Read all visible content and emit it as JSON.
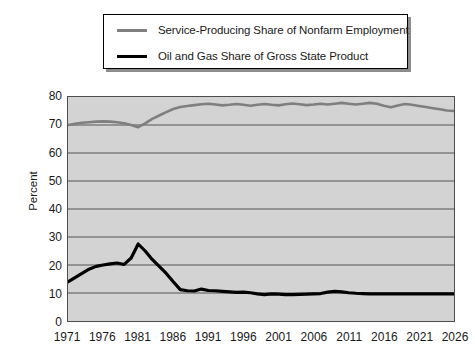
{
  "chart_data": {
    "type": "line",
    "title": "",
    "subtitle": "",
    "xlabel": "",
    "ylabel": "Percent",
    "ylim": [
      0,
      80
    ],
    "xlim": [
      1971,
      2026
    ],
    "yticks": [
      0,
      10,
      20,
      30,
      40,
      50,
      60,
      70,
      80
    ],
    "xticks": [
      1971,
      1976,
      1981,
      1986,
      1991,
      1996,
      2001,
      2006,
      2011,
      2016,
      2021,
      2026
    ],
    "grid": true,
    "legend_position": "above-plot",
    "plot_background": "#d3d3d3",
    "series": [
      {
        "name": "Service-Producing Share of Nonfarm Employment",
        "color": "#7f7f7f",
        "x": [
          1971,
          1972,
          1973,
          1974,
          1975,
          1976,
          1977,
          1978,
          1979,
          1980,
          1981,
          1982,
          1983,
          1984,
          1985,
          1986,
          1987,
          1988,
          1989,
          1990,
          1991,
          1992,
          1993,
          1994,
          1995,
          1996,
          1997,
          1998,
          1999,
          2000,
          2001,
          2002,
          2003,
          2004,
          2005,
          2006,
          2007,
          2008,
          2009,
          2010,
          2011,
          2012,
          2013,
          2014,
          2015,
          2016,
          2017,
          2018,
          2019,
          2020,
          2021,
          2022,
          2023,
          2024,
          2025,
          2026
        ],
        "values": [
          70.0,
          70.4,
          70.8,
          71.0,
          71.2,
          71.3,
          71.2,
          71.0,
          70.6,
          70.0,
          69.2,
          70.6,
          72.2,
          73.4,
          74.6,
          75.7,
          76.4,
          76.8,
          77.1,
          77.4,
          77.6,
          77.3,
          77.0,
          77.2,
          77.5,
          77.2,
          76.9,
          77.2,
          77.5,
          77.2,
          77.0,
          77.4,
          77.7,
          77.4,
          77.1,
          77.3,
          77.6,
          77.3,
          77.6,
          77.9,
          77.6,
          77.3,
          77.6,
          77.9,
          77.6,
          76.9,
          76.3,
          77.0,
          77.5,
          77.2,
          76.8,
          76.4,
          76.0,
          75.6,
          75.2,
          75.0
        ]
      },
      {
        "name": "Oil and Gas Share of Gross State Product",
        "color": "#000000",
        "x": [
          1971,
          1972,
          1973,
          1974,
          1975,
          1976,
          1977,
          1978,
          1979,
          1980,
          1981,
          1982,
          1983,
          1984,
          1985,
          1986,
          1987,
          1988,
          1989,
          1990,
          1991,
          1992,
          1993,
          1994,
          1995,
          1996,
          1997,
          1998,
          1999,
          2000,
          2001,
          2002,
          2003,
          2004,
          2005,
          2006,
          2007,
          2008,
          2009,
          2010,
          2011,
          2012,
          2013,
          2014,
          2015,
          2016,
          2017,
          2018,
          2019,
          2020,
          2021,
          2022,
          2023,
          2024,
          2025,
          2026
        ],
        "values": [
          14.0,
          15.5,
          17.0,
          18.5,
          19.5,
          20.0,
          20.4,
          20.7,
          20.2,
          22.5,
          27.5,
          25.0,
          22.0,
          19.5,
          17.0,
          14.0,
          11.2,
          10.8,
          10.7,
          11.4,
          10.9,
          10.8,
          10.6,
          10.4,
          10.2,
          10.3,
          10.1,
          9.7,
          9.4,
          9.7,
          9.6,
          9.4,
          9.4,
          9.5,
          9.6,
          9.7,
          9.8,
          10.3,
          10.6,
          10.4,
          10.1,
          9.9,
          9.8,
          9.7,
          9.7,
          9.7,
          9.7,
          9.7,
          9.7,
          9.7,
          9.7,
          9.7,
          9.7,
          9.7,
          9.7,
          9.7
        ]
      }
    ]
  },
  "legend": {
    "entries": [
      {
        "label": "Service-Producing Share of Nonfarm Employment",
        "color": "#7f7f7f"
      },
      {
        "label": "Oil and Gas Share of Gross State Product",
        "color": "#000000"
      }
    ]
  },
  "axes": {
    "ylabel": "Percent",
    "ytick_labels": [
      "80",
      "70",
      "60",
      "50",
      "40",
      "30",
      "20",
      "10",
      "0"
    ],
    "xtick_labels": [
      "1971",
      "1976",
      "1981",
      "1986",
      "1991",
      "1996",
      "2001",
      "2006",
      "2011",
      "2016",
      "2021",
      "2026"
    ]
  }
}
